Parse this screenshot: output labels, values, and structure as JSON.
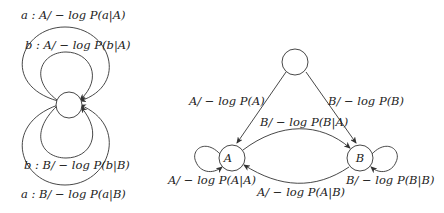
{
  "left_diagram": {
    "nodes": [
      {
        "id": "center",
        "label": ""
      }
    ],
    "edges": [
      {
        "id": "loop-a-A",
        "label": "a : A/ − log P(a|A)"
      },
      {
        "id": "loop-b-A",
        "label": "b : A/ − log P(b|A)"
      },
      {
        "id": "loop-b-B",
        "label": "b : B/ − log P(b|B)"
      },
      {
        "id": "loop-a-B",
        "label": "a : B/ − log P(a|B)"
      }
    ]
  },
  "right_diagram": {
    "nodes": [
      {
        "id": "start",
        "label": ""
      },
      {
        "id": "A",
        "label": "A"
      },
      {
        "id": "B",
        "label": "B"
      }
    ],
    "edges": [
      {
        "id": "start-A",
        "label": "A/ − log P(A)"
      },
      {
        "id": "start-B",
        "label": "B/ − log P(B)"
      },
      {
        "id": "A-B",
        "label": "B/ − log P(B|A)"
      },
      {
        "id": "B-A",
        "label": "A/ − log P(A|B)"
      },
      {
        "id": "A-A",
        "label": "A/ − log P(A|A)"
      },
      {
        "id": "B-B",
        "label": "B/ − log P(B|B)"
      }
    ]
  }
}
